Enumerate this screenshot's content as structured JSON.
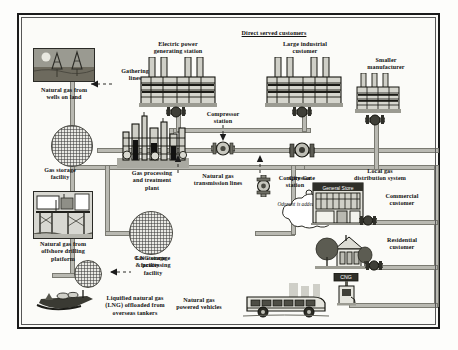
{
  "diagram": {
    "title_group": "Direct served customers",
    "nodes": {
      "wells_on_land": "Natural gas from\nwells on land",
      "gathering_lines": "Gathering\nlines",
      "gas_storage_left": "Gas storage\nfacility",
      "processing_plant": "Gas processing\nand treatment\nplant",
      "transmission_lines": "Natural gas\ntransmission lines",
      "compressor_top": "Compressor\nstation",
      "compressor_mid": "Compressor\nstation",
      "city_gate": "City Gate",
      "local_distribution": "Local gas\ndistribution system",
      "electric_power": "Electric power\ngenerating station",
      "large_industrial": "Large industrial\ncustomer",
      "smaller_manufacturer": "Smaller\nmanufacturer",
      "commercial_customer": "Commercial\ncustomer",
      "residential_customer": "Residential\ncustomer",
      "ng_vehicles": "Natural gas\npowered vehicles",
      "offshore_platform": "Natural gas from\noffshore drilling\nplatform",
      "lng_facility": "LNG storage\n& processing\nfacility",
      "lng_tankers": "Liquified natural gas\n(LNG) offloaded from\noverseas tankers",
      "gas_storage_mid": "Gas storage\nfacility"
    },
    "callout": {
      "odorant_note": "Odorant is added\nto the gas at the\ncity gate"
    },
    "signage": {
      "general_store": "General Store",
      "cng_station": "CNG"
    },
    "colors": {
      "pipe_fill": "#b9b9b2",
      "pipe_stroke": "#7a7a72",
      "border": "#1b1b1b",
      "paper": "#fbfbf8",
      "ink": "#111111"
    }
  }
}
